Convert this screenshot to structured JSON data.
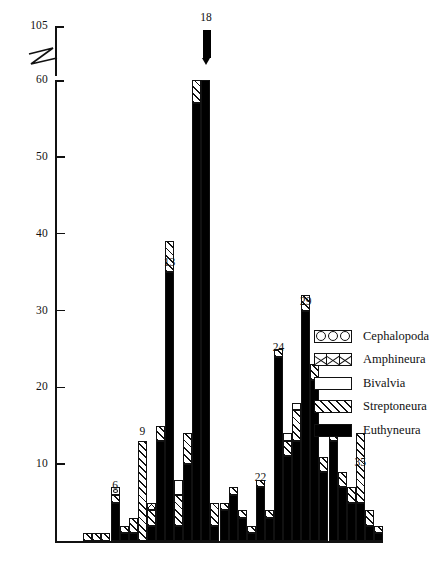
{
  "chart_data": {
    "type": "bar",
    "title": "",
    "subtitle": "",
    "xlabel": "",
    "ylabel": "",
    "stacked": true,
    "grid": false,
    "legend_position": "right",
    "ylim": [
      0,
      105
    ],
    "y_ticks": [
      10,
      20,
      30,
      40,
      50,
      60,
      105
    ],
    "y_tick_labels": [
      "10",
      "20",
      "30",
      "40",
      "50",
      "60",
      "105"
    ],
    "axis_break": {
      "from": 60,
      "to": 105,
      "style": "zigzag"
    },
    "series": [
      {
        "name": "Cephalopoda",
        "pattern": "circles",
        "values": [
          0,
          0,
          0,
          0,
          0,
          0,
          1,
          0,
          0,
          0,
          0,
          0,
          0,
          0,
          0,
          0,
          0,
          0,
          0,
          0,
          0,
          0,
          0,
          0,
          0,
          0,
          0,
          0,
          0,
          0,
          0,
          0,
          0,
          0,
          0,
          0
        ]
      },
      {
        "name": "Amphineura",
        "pattern": "crosses",
        "values": [
          0,
          0,
          0,
          0,
          0,
          0,
          0,
          0,
          0,
          0,
          1,
          0,
          0,
          0,
          0,
          0,
          0,
          0,
          0,
          0,
          0,
          0,
          0,
          0,
          0,
          0,
          0,
          0,
          0,
          0,
          0,
          0,
          0,
          0,
          0,
          0
        ]
      },
      {
        "name": "Bivalvia",
        "pattern": "open",
        "values": [
          0,
          0,
          0,
          0,
          0,
          0,
          0,
          0,
          0,
          0,
          0,
          0,
          0,
          2,
          0,
          0,
          2,
          0,
          0,
          0,
          0,
          0,
          0,
          0,
          0,
          1,
          1,
          0,
          0,
          0,
          0,
          0,
          0,
          0,
          0,
          0
        ]
      },
      {
        "name": "Streptoneura",
        "pattern": "hatch",
        "values": [
          0,
          0,
          0,
          1,
          1,
          1,
          1,
          1,
          2,
          13,
          2,
          2,
          4,
          4,
          4,
          9,
          26,
          3,
          1,
          1,
          1,
          1,
          1,
          1,
          1,
          2,
          4,
          2,
          2,
          2,
          2,
          2,
          2,
          9,
          2,
          1
        ]
      },
      {
        "name": "Euthyneura",
        "pattern": "solid",
        "values": [
          0,
          0,
          0,
          0,
          0,
          0,
          5,
          1,
          1,
          0,
          2,
          13,
          35,
          2,
          10,
          57,
          105,
          2,
          4,
          6,
          3,
          1,
          7,
          3,
          24,
          11,
          13,
          30,
          21,
          9,
          13,
          7,
          5,
          5,
          2,
          1
        ]
      }
    ],
    "peak_labels": [
      {
        "text": "6",
        "x_index": 6,
        "value": 6
      },
      {
        "text": "9",
        "x_index": 9,
        "value": 13
      },
      {
        "text": "13",
        "x_index": 12,
        "value": 35
      },
      {
        "text": "18",
        "x_index": 16,
        "value": 105
      },
      {
        "text": "22",
        "x_index": 22,
        "value": 7
      },
      {
        "text": "24",
        "x_index": 24,
        "value": 24
      },
      {
        "text": "29",
        "x_index": 27,
        "value": 30
      },
      {
        "text": "35",
        "x_index": 33,
        "value": 9
      }
    ]
  },
  "legend": {
    "items": [
      {
        "label": "Cephalopoda",
        "pattern": "circles"
      },
      {
        "label": "Amphineura",
        "pattern": "crosses"
      },
      {
        "label": "Bivalvia",
        "pattern": "open"
      },
      {
        "label": "Streptoneura",
        "pattern": "hatch"
      },
      {
        "label": "Euthyneura",
        "pattern": "solid"
      }
    ]
  },
  "colors": {
    "ink": "#111111",
    "fill_solid": "#000000",
    "background": "#ffffff"
  }
}
